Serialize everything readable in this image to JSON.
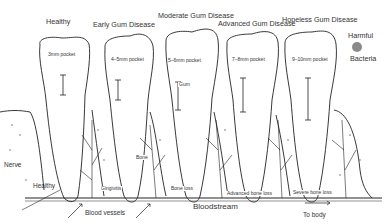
{
  "stages": [
    {
      "title": "Healthy",
      "pocket": "3mm pocket",
      "bottom_label": "Gingivitis"
    },
    {
      "title": "Early Gum Disease",
      "pocket": "4–5mm pocket",
      "bottom_label": "Bone loss"
    },
    {
      "title": "Moderate Gum Disease",
      "pocket": "5–6mm pocket",
      "bottom_label": "Advanced bone loss"
    },
    {
      "title": "Advanced Gum Disease",
      "pocket": "7–8mm pocket",
      "bottom_label": "Severe bone loss"
    },
    {
      "title": "Hopeless Gum Disease",
      "pocket": "9–10mm pocket"
    }
  ],
  "legend": {
    "line1": "Harmful",
    "line2": "Bacteria",
    "dot_color": "#8a8a8a"
  },
  "labels": {
    "nerve": "Nerve",
    "healthy_root": "Healthy",
    "gum": "Gum",
    "bone": "Bone",
    "blood_vessels": "Blood vessels",
    "bloodstream": "Bloodstream",
    "to_body": "To body"
  }
}
